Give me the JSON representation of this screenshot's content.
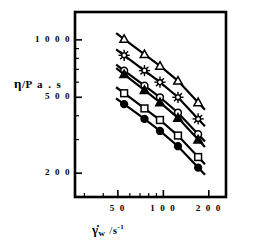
{
  "figure": {
    "background": "#ffffff",
    "ink": "#000000",
    "frame": {
      "left": 75,
      "top": 12,
      "right": 226,
      "bottom": 197
    }
  },
  "axes": {
    "y": {
      "label_eta": "η",
      "label_sep": "/",
      "label_unit": "P a . s",
      "full_label": "η / Pa.s",
      "scale": "log",
      "min": 150,
      "max": 1400,
      "major_ticks": [
        200,
        500,
        1000
      ],
      "major_tick_labels": [
        "2 0 0",
        "5 0 0",
        "1 0 0 0"
      ],
      "minor_ticks": [
        300,
        400,
        600,
        700,
        800,
        900
      ]
    },
    "x": {
      "label_gamma": "γ̇",
      "label_sub": "w",
      "label_sep": "/",
      "label_unit": "s",
      "label_sup": "-1",
      "full_label": "γ̇w / s-1",
      "scale": "log",
      "min": 26,
      "max": 260,
      "major_ticks": [
        50,
        100,
        200
      ],
      "major_tick_labels": [
        "5 0",
        "1 0 0",
        "2 0 0"
      ],
      "minor_ticks": [
        30,
        40,
        60,
        70,
        80,
        90
      ]
    }
  },
  "chart_data": {
    "type": "line",
    "title": "",
    "subtitle": "",
    "xlabel": "γ̇w / s-1",
    "ylabel": "η / Pa.s",
    "xscale": "log",
    "yscale": "log",
    "xlim": [
      26,
      260
    ],
    "ylim": [
      150,
      1400
    ],
    "grid": false,
    "legend": "none",
    "x": [
      55,
      75,
      95,
      125,
      170
    ],
    "series": [
      {
        "name": "series-1",
        "marker": "open-triangle",
        "fill": "#ffffff",
        "stroke": "#000000",
        "values": [
          1010,
          840,
          730,
          610,
          470
        ]
      },
      {
        "name": "series-2",
        "marker": "star",
        "fill": "#ffffff",
        "stroke": "#000000",
        "values": [
          830,
          690,
          600,
          500,
          385
        ]
      },
      {
        "name": "series-3",
        "marker": "open-circle",
        "fill": "#ffffff",
        "stroke": "#000000",
        "values": [
          690,
          575,
          500,
          415,
          320
        ]
      },
      {
        "name": "series-4",
        "marker": "filled-triangle",
        "fill": "#000000",
        "stroke": "#000000",
        "values": [
          660,
          545,
          470,
          390,
          300
        ]
      },
      {
        "name": "series-5",
        "marker": "open-square",
        "fill": "#ffffff",
        "stroke": "#000000",
        "values": [
          525,
          437,
          380,
          315,
          243
        ]
      },
      {
        "name": "series-6",
        "marker": "filled-circle",
        "fill": "#000000",
        "stroke": "#000000",
        "values": [
          460,
          385,
          333,
          277,
          214
        ]
      }
    ]
  }
}
